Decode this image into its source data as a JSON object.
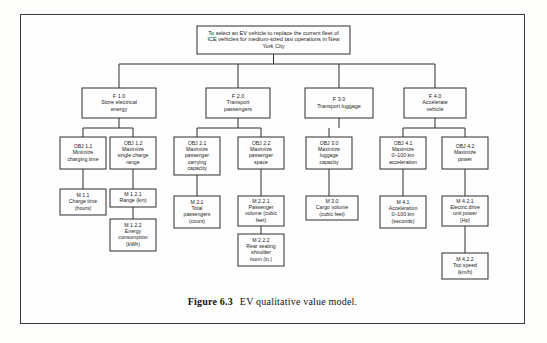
{
  "figure": {
    "caption_label": "Figure 6.3",
    "caption_text": "EV qualitative value model.",
    "border_color": "#3a3a3a",
    "box_stroke_color": "#2d2d2d",
    "background_color": "#fefefe",
    "text_color": "#1d1d1d"
  },
  "diagram_data": {
    "type": "hierarchy-tree",
    "levels": [
      "goal",
      "function",
      "objective",
      "measure"
    ],
    "goal": {
      "id": "goal",
      "lines": [
        "To select an EV vehicle to replace the current fleet of",
        "ICE vehicles for medium-sized taxi operations in New",
        "York City"
      ]
    },
    "functions": [
      {
        "id": "F1.0",
        "code": "F 1.0",
        "lines": [
          "F 1.0",
          "Store electrical",
          "energy"
        ]
      },
      {
        "id": "F2.0",
        "code": "F 2.0",
        "lines": [
          "F 2.0",
          "Transport",
          "passengers"
        ]
      },
      {
        "id": "F3.0",
        "code": "F 3.0",
        "lines": [
          "F 3.0",
          "Transport luggage"
        ]
      },
      {
        "id": "F4.0",
        "code": "F 4.0",
        "lines": [
          "F 4.0",
          "Accelerate",
          "vehicle"
        ]
      }
    ],
    "objectives": [
      {
        "id": "OBJ1.1",
        "parent": "F1.0",
        "lines": [
          "OBJ 1.1",
          "Minimize",
          "charging time"
        ]
      },
      {
        "id": "OBJ1.2",
        "parent": "F1.0",
        "lines": [
          "OBJ 1.2",
          "Maximize",
          "single charge",
          "range"
        ]
      },
      {
        "id": "OBJ2.1",
        "parent": "F2.0",
        "lines": [
          "OBJ 2.1",
          "Maximize",
          "passenger",
          "carrying",
          "capacity"
        ]
      },
      {
        "id": "OBJ2.2",
        "parent": "F2.0",
        "lines": [
          "OBJ 2.2",
          "Maximize",
          "passenger",
          "space"
        ]
      },
      {
        "id": "OBJ3.0",
        "parent": "F3.0",
        "lines": [
          "OBJ 3.0",
          "Maximize",
          "luggage",
          "capacity"
        ]
      },
      {
        "id": "OBJ4.1",
        "parent": "F4.0",
        "lines": [
          "OBJ 4.1",
          "Maximize",
          "0–100 km",
          "acceleration"
        ]
      },
      {
        "id": "OBJ4.2",
        "parent": "F4.0",
        "lines": [
          "OBJ 4.2",
          "Maximize",
          "power"
        ]
      }
    ],
    "measures": [
      {
        "id": "M1.1",
        "parent": "OBJ1.1",
        "lines": [
          "M 1.1",
          "Charge time",
          "(hours)"
        ]
      },
      {
        "id": "M1.2.1",
        "parent": "OBJ1.2",
        "lines": [
          "M 1.2.1",
          "Range (km)"
        ]
      },
      {
        "id": "M1.2.2",
        "parent": "M1.2.1",
        "lines": [
          "M 1.2.2",
          "Energy",
          "consumption",
          "(kWh)"
        ]
      },
      {
        "id": "M2.1",
        "parent": "OBJ2.1",
        "lines": [
          "M 2.1",
          "Total",
          "passengers",
          "(count)"
        ]
      },
      {
        "id": "M2.2.1",
        "parent": "OBJ2.2",
        "lines": [
          "M 2.2.1",
          "Passenger",
          "volume (cubic",
          "feet)"
        ]
      },
      {
        "id": "M2.2.2",
        "parent": "M2.2.1",
        "lines": [
          "M 2.2.2",
          "Rear seating",
          "shoulder",
          "room (in.)"
        ]
      },
      {
        "id": "M3.0",
        "parent": "OBJ3.0",
        "lines": [
          "M 3.0",
          "Cargo volume",
          "(cubic feet)"
        ]
      },
      {
        "id": "M4.1",
        "parent": "OBJ4.1",
        "lines": [
          "M 4.1",
          "Acceleration",
          "0–100 km",
          "(seconds)"
        ]
      },
      {
        "id": "M4.2.1",
        "parent": "OBJ4.2",
        "lines": [
          "M 4.2.1",
          "Electric drive",
          "unit power",
          "(Hp)"
        ]
      },
      {
        "id": "M4.2.2",
        "parent": "M4.2.1",
        "lines": [
          "M 4.2.2",
          "Top speed",
          "(km/h)"
        ]
      }
    ]
  },
  "layout": {
    "goal": {
      "x": 197,
      "y": 26,
      "w": 153,
      "h": 28
    },
    "functions": {
      "F1.0": {
        "x": 82,
        "y": 88,
        "w": 74,
        "h": 30
      },
      "F2.0": {
        "x": 206,
        "y": 88,
        "w": 64,
        "h": 30
      },
      "F3.0": {
        "x": 305,
        "y": 88,
        "w": 68,
        "h": 30
      },
      "F4.0": {
        "x": 404,
        "y": 88,
        "w": 62,
        "h": 30
      }
    },
    "objectives": {
      "OBJ1.1": {
        "x": 60,
        "y": 137,
        "w": 46,
        "h": 32
      },
      "OBJ1.2": {
        "x": 110,
        "y": 137,
        "w": 46,
        "h": 32
      },
      "OBJ2.1": {
        "x": 174,
        "y": 137,
        "w": 46,
        "h": 38
      },
      "OBJ2.2": {
        "x": 238,
        "y": 137,
        "w": 46,
        "h": 32
      },
      "OBJ3.0": {
        "x": 306,
        "y": 137,
        "w": 46,
        "h": 32
      },
      "OBJ4.1": {
        "x": 380,
        "y": 137,
        "w": 46,
        "h": 32
      },
      "OBJ4.2": {
        "x": 442,
        "y": 137,
        "w": 46,
        "h": 32
      }
    },
    "measures": {
      "M1.1": {
        "x": 60,
        "y": 189,
        "w": 46,
        "h": 26
      },
      "M1.2.1": {
        "x": 110,
        "y": 189,
        "w": 46,
        "h": 18
      },
      "M1.2.2": {
        "x": 110,
        "y": 219,
        "w": 46,
        "h": 32
      },
      "M2.1": {
        "x": 174,
        "y": 196,
        "w": 46,
        "h": 32
      },
      "M2.2.1": {
        "x": 238,
        "y": 196,
        "w": 46,
        "h": 30
      },
      "M2.2.2": {
        "x": 238,
        "y": 234,
        "w": 46,
        "h": 32
      },
      "M3.0": {
        "x": 306,
        "y": 196,
        "w": 52,
        "h": 24
      },
      "M4.1": {
        "x": 380,
        "y": 196,
        "w": 46,
        "h": 32
      },
      "M4.2.1": {
        "x": 442,
        "y": 196,
        "w": 46,
        "h": 30
      },
      "M4.2.2": {
        "x": 442,
        "y": 253,
        "w": 46,
        "h": 26
      }
    }
  }
}
